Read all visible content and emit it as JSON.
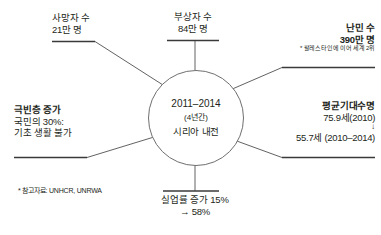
{
  "center": {
    "years": "2011–2014",
    "duration": "(4년간)",
    "name": "시리아 내전"
  },
  "nodes": {
    "deaths": {
      "title": "사망자 수",
      "value": "21만 명"
    },
    "injured": {
      "title": "부상자 수",
      "value": "84만 명"
    },
    "refugees": {
      "title": "난민 수",
      "value": "390만 명",
      "note": "* 팔레스타인에 이어 세계 2위"
    },
    "poverty": {
      "title": "극빈층 증가",
      "line1": "국민의 30%:",
      "line2": "기초 생활 불가"
    },
    "life_expectancy": {
      "title": "평균기대수명",
      "before": "75.9세(2010)",
      "arrow": "↓",
      "after": "55.7세 (2010–2014)"
    },
    "unemployment": {
      "line1": "실업률 증가 15%",
      "line2": "→ 58%"
    },
    "source": {
      "text": "* 참고자료: UNHCR, UNRWA"
    }
  },
  "colors": {
    "text": "#231f20",
    "line": "#3a3a3a",
    "circle_stroke": "#6f6f6f",
    "background": "#ffffff"
  }
}
